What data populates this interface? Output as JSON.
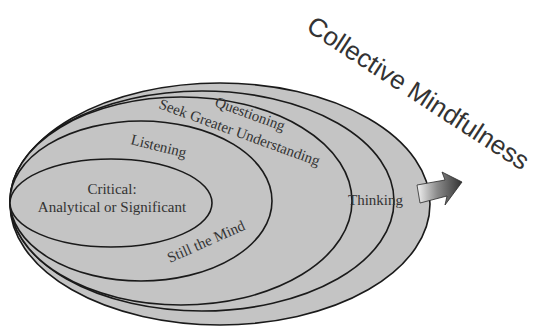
{
  "title": "Collective Mindfulness",
  "rings": [
    {
      "id": "thinking",
      "label": "Thinking"
    },
    {
      "id": "questioning",
      "label": "Questioning"
    },
    {
      "id": "seek-greater-understanding",
      "label": "Seek Greater Understanding"
    },
    {
      "id": "listening",
      "label": "Listening"
    },
    {
      "id": "still-the-mind",
      "label": "Still the Mind"
    },
    {
      "id": "critical",
      "label_line1": "Critical:",
      "label_line2": "Analytical or Significant"
    }
  ],
  "arrow": {
    "icon": "arrow-right-up-icon",
    "direction": "toward Collective Mindfulness"
  },
  "colors": {
    "fill": "#c4c4c4",
    "stroke": "#1a1a1a",
    "text": "#333333",
    "arrow_dark": "#3a3a3a",
    "arrow_light": "#f2f2f2",
    "background": "#ffffff"
  }
}
